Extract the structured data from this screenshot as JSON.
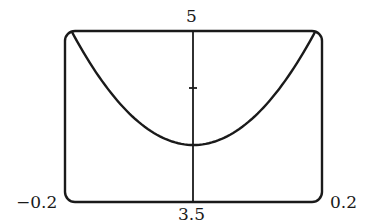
{
  "chart_data": {
    "type": "line",
    "title": "",
    "xlabel": "",
    "ylabel": "",
    "xlim": [
      -0.2,
      0.2
    ],
    "ylim": [
      3.5,
      5
    ],
    "grid": false,
    "legend": null,
    "tick_labels": {
      "x_min": "−0.2",
      "x_max": "0.2",
      "y_min": "3.5",
      "y_max": "5"
    },
    "y_axis_ticks": [
      4.25
    ],
    "series": [
      {
        "name": "curve",
        "x": [
          -0.19,
          -0.15,
          -0.1,
          -0.05,
          0,
          0.05,
          0.1,
          0.15,
          0.19
        ],
        "y": [
          5.0,
          4.62,
          4.28,
          4.07,
          4.0,
          4.07,
          4.28,
          4.62,
          5.0
        ]
      }
    ],
    "colors": {
      "line": "#1a1a1a",
      "frame": "#1a1a1a",
      "background": "#ffffff"
    }
  }
}
